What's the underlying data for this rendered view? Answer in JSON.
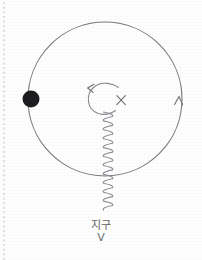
{
  "page": {
    "kind": "hand-drawn-notebook-diagram",
    "background_color": "#fefefe",
    "ink_color": "#6b6b70",
    "dark_ink_color": "#1d1d1f",
    "width": 202,
    "height": 260
  },
  "margin": {
    "name": "perforation-dots",
    "color": "#c9c9cf",
    "x": 4,
    "dot_count": 56
  },
  "diagram": {
    "orbit": {
      "label": "orbit-circle",
      "center_x": 105,
      "center_y": 99,
      "radius": 77,
      "stroke": "#75757b",
      "stroke_width": 1.1
    },
    "satellite": {
      "label": "satellite-dot",
      "cx": 31,
      "cy": 99,
      "r": 8.5,
      "fill": "#1d1d1f"
    },
    "direction_arrow": {
      "label": "orbit-direction-arrowhead",
      "x": 179,
      "y": 98,
      "points_toward": "up",
      "stroke": "#6b6b70"
    },
    "spin_arrow": {
      "label": "rotation-curved-arrow",
      "center_x": 103,
      "center_y": 98,
      "radius": 15,
      "points_toward": "left",
      "stroke": "#85858b"
    },
    "cross_mark": {
      "label": "x-mark",
      "cx": 121,
      "cy": 100,
      "size": 9,
      "stroke": "#6e6e74"
    },
    "wave": {
      "label": "signal-wave",
      "x": 108,
      "y_start": 112,
      "y_end": 210,
      "amplitude": 4.5,
      "wavelength": 9,
      "stroke": "#8a8a90"
    }
  },
  "labels": {
    "earth": "지구",
    "vee": "V"
  }
}
